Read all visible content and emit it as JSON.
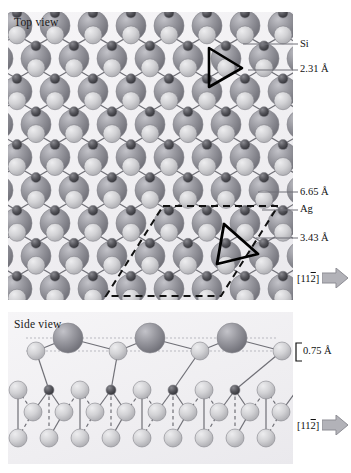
{
  "figure": {
    "panels": [
      {
        "id": "top",
        "title": "Top view"
      },
      {
        "id": "side",
        "title": "Side view"
      }
    ],
    "labels": {
      "si": "Si",
      "ag": "Ag",
      "d_si_si": "2.31 Å",
      "d_cell": "6.65 Å",
      "d_ag": "3.43 Å",
      "buckling": "0.75 Å"
    },
    "directions": {
      "bracket_open": "[11",
      "overbar_index": "2",
      "bracket_close": "]"
    }
  },
  "chart_data": {
    "type": "diagram",
    "species": [
      {
        "name": "Si",
        "role": "upper silicon atom",
        "color": "#c8c8cb",
        "radius_px": 9
      },
      {
        "name": "Si",
        "role": "lower silicon atom",
        "color": "#4a4a4f",
        "radius_px": 5
      },
      {
        "name": "Ag",
        "role": "silver substrate atom",
        "color": "#8f8f96",
        "radius_px": 15
      }
    ],
    "measurements": [
      {
        "label": "2.31 Å",
        "quantity": "Si–Si bond length",
        "value": 2.31,
        "unit": "Å"
      },
      {
        "label": "6.65 Å",
        "quantity": "surface unit cell vector",
        "value": 6.65,
        "unit": "Å"
      },
      {
        "label": "3.43 Å",
        "quantity": "Ag–Ag nearest distance",
        "value": 3.43,
        "unit": "Å"
      },
      {
        "label": "0.75 Å",
        "quantity": "buckling height",
        "value": 0.75,
        "unit": "Å"
      }
    ],
    "annotations": [
      {
        "type": "triangle",
        "panel": "top",
        "description": "Si trimer highlight upper right"
      },
      {
        "type": "triangle",
        "panel": "top",
        "description": "Si trimer highlight lower centre"
      },
      {
        "type": "rhombus",
        "panel": "top",
        "style": "dashed",
        "description": "surface unit cell"
      },
      {
        "type": "direction-arrow",
        "panel": "top",
        "label": "[112]"
      },
      {
        "type": "direction-arrow",
        "panel": "side",
        "label": "[112]"
      }
    ],
    "lattice": {
      "periodicity_px": 38,
      "symmetry": "hexagonal / honeycomb"
    }
  }
}
